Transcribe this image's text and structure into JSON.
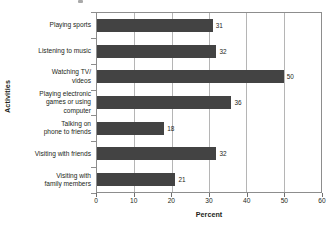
{
  "chart_data": {
    "type": "bar",
    "orientation": "horizontal",
    "title": "",
    "xlabel": "Percent",
    "ylabel": "Activities",
    "xlim": [
      0,
      60
    ],
    "xticks": [
      0,
      10,
      20,
      30,
      40,
      50,
      60
    ],
    "xtick_labels": [
      "0",
      "10",
      "20",
      "30",
      "40",
      "50",
      "60"
    ],
    "grid": "vertical",
    "legend": "none",
    "bar_color": "#434343",
    "frame_color": "#8d8d8d",
    "gridline_color": "#b5b5b5",
    "categories": [
      "Playing sports",
      "Listening to music",
      "Watching TV/ videos",
      "Playing electronic games or using computer",
      "Talking on phone to friends",
      "Visiting with friends",
      "Visiting with family members"
    ],
    "category_lines": [
      [
        "Playing sports"
      ],
      [
        "Listening to music"
      ],
      [
        "Watching TV/",
        "videos"
      ],
      [
        "Playing electronic",
        "games or using",
        "computer"
      ],
      [
        "Talking on",
        "phone to friends"
      ],
      [
        "Visiting with friends"
      ],
      [
        "Visiting with",
        "family members"
      ]
    ],
    "values": [
      31,
      32,
      50,
      36,
      18,
      32,
      21
    ],
    "value_labels": [
      "31",
      "32",
      "50",
      "36",
      "18",
      "32",
      "21"
    ]
  },
  "axes": {
    "y_title": "Activities",
    "x_title": "Percent"
  },
  "bars": [
    {
      "label": "Playing sports",
      "value": 31,
      "value_label": "31"
    },
    {
      "label": "Listening to music",
      "value": 32,
      "value_label": "32"
    },
    {
      "label": "Watching TV/ videos",
      "value": 50,
      "value_label": "50"
    },
    {
      "label": "Playing electronic games or using computer",
      "value": 36,
      "value_label": "36"
    },
    {
      "label": "Talking on phone to friends",
      "value": 18,
      "value_label": "18"
    },
    {
      "label": "Visiting with friends",
      "value": 32,
      "value_label": "32"
    },
    {
      "label": "Visiting with family members",
      "value": 21,
      "value_label": "21"
    }
  ]
}
